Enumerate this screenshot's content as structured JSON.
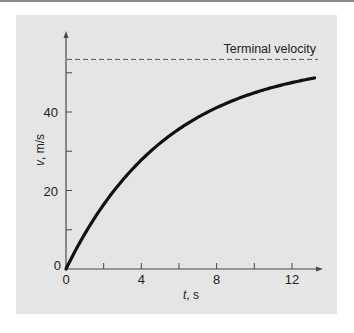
{
  "chart_data": {
    "type": "line",
    "title": "",
    "xlabel": "t, s",
    "ylabel": "v, m/s",
    "xlim": [
      0,
      13.5
    ],
    "ylim": [
      0,
      58
    ],
    "x_ticks": [
      0,
      2,
      4,
      6,
      8,
      10,
      12
    ],
    "x_tick_labels": [
      "0",
      "",
      "4",
      "",
      "8",
      "",
      "12"
    ],
    "y_ticks": [
      0,
      10,
      20,
      30,
      40,
      50
    ],
    "y_tick_labels": [
      "0",
      "",
      "20",
      "",
      "40",
      ""
    ],
    "grid": false,
    "series": [
      {
        "name": "velocity",
        "style": "solid-thick",
        "x": [
          0,
          1,
          2,
          3,
          4,
          5,
          6,
          7,
          8,
          9,
          10,
          11,
          12,
          13.2
        ],
        "values": [
          0,
          8.97,
          16.4,
          22.6,
          27.8,
          32.1,
          35.6,
          38.6,
          41.0,
          43.1,
          44.8,
          46.2,
          47.4,
          48.6
        ]
      }
    ],
    "reference_lines": [
      {
        "name": "Terminal velocity",
        "type": "horizontal",
        "style": "dashed",
        "y": 53.4
      }
    ],
    "annotations": [
      {
        "text": "Terminal velocity",
        "position": "above dashed line, right"
      }
    ]
  },
  "labels": {
    "annotation": "Terminal velocity",
    "xlabel_var": "t",
    "xlabel_unit": ", s",
    "ylabel_var": "v",
    "ylabel_unit": ", m/s",
    "y_origin": "0",
    "x_origin": "0"
  }
}
